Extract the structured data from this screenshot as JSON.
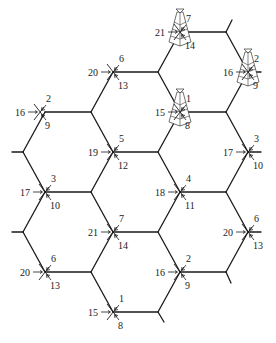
{
  "diagram": {
    "type": "hexagonal-cell-frequency-plan",
    "colors": {
      "line": "#1a1a1a",
      "background": "#ffffff"
    },
    "edges": [
      [
        12,
        152,
        23,
        152
      ],
      [
        23,
        152,
        45,
        112
      ],
      [
        23,
        152,
        45,
        192
      ],
      [
        12,
        232,
        23,
        232
      ],
      [
        23,
        232,
        45,
        192
      ],
      [
        23,
        232,
        45,
        272
      ],
      [
        45,
        112,
        91,
        112
      ],
      [
        45,
        192,
        91,
        192
      ],
      [
        45,
        272,
        91,
        272
      ],
      [
        91,
        112,
        113,
        72
      ],
      [
        91,
        112,
        113,
        152
      ],
      [
        91,
        192,
        113,
        152
      ],
      [
        91,
        192,
        113,
        232
      ],
      [
        91,
        272,
        113,
        232
      ],
      [
        91,
        272,
        113,
        312
      ],
      [
        113,
        72,
        158,
        72
      ],
      [
        113,
        152,
        158,
        152
      ],
      [
        113,
        232,
        158,
        232
      ],
      [
        113,
        312,
        158,
        312
      ],
      [
        158,
        72,
        180,
        32
      ],
      [
        158,
        72,
        180,
        112
      ],
      [
        158,
        152,
        180,
        112
      ],
      [
        158,
        152,
        180,
        192
      ],
      [
        158,
        232,
        180,
        192
      ],
      [
        158,
        232,
        180,
        272
      ],
      [
        158,
        312,
        180,
        272
      ],
      [
        158,
        312,
        164,
        322
      ],
      [
        180,
        32,
        226,
        32
      ],
      [
        180,
        112,
        226,
        112
      ],
      [
        180,
        192,
        226,
        192
      ],
      [
        180,
        272,
        226,
        272
      ],
      [
        226,
        32,
        232,
        20
      ],
      [
        226,
        32,
        248,
        72
      ],
      [
        226,
        112,
        248,
        72
      ],
      [
        226,
        112,
        248,
        152
      ],
      [
        226,
        192,
        248,
        152
      ],
      [
        226,
        192,
        248,
        232
      ],
      [
        226,
        272,
        248,
        232
      ],
      [
        226,
        272,
        231,
        283
      ],
      [
        248,
        72,
        261,
        72
      ],
      [
        248,
        152,
        261,
        152
      ],
      [
        248,
        232,
        261,
        232
      ]
    ],
    "sites": [
      {
        "id": "site-a",
        "x": 113,
        "y": 72,
        "left": "20",
        "upper": "6",
        "lower": "13",
        "antenna": false
      },
      {
        "id": "site-b",
        "x": 180,
        "y": 32,
        "left": "21",
        "upper": "7",
        "lower": "14",
        "antenna": true
      },
      {
        "id": "site-c",
        "x": 40,
        "y": 112,
        "left": "16",
        "upper": "2",
        "lower": "9",
        "antenna": false
      },
      {
        "id": "site-d",
        "x": 248,
        "y": 72,
        "left": "16",
        "upper": "2",
        "lower": "9",
        "antenna": true
      },
      {
        "id": "site-e",
        "x": 180,
        "y": 112,
        "left": "15",
        "upper": "1",
        "lower": "8",
        "antenna": true
      },
      {
        "id": "site-f",
        "x": 113,
        "y": 152,
        "left": "19",
        "upper": "5",
        "lower": "12",
        "antenna": false
      },
      {
        "id": "site-g",
        "x": 248,
        "y": 152,
        "left": "17",
        "upper": "3",
        "lower": "10",
        "antenna": false
      },
      {
        "id": "site-h",
        "x": 45,
        "y": 192,
        "left": "17",
        "upper": "3",
        "lower": "10",
        "antenna": false
      },
      {
        "id": "site-i",
        "x": 180,
        "y": 192,
        "left": "18",
        "upper": "4",
        "lower": "11",
        "antenna": false
      },
      {
        "id": "site-j",
        "x": 113,
        "y": 232,
        "left": "21",
        "upper": "7",
        "lower": "14",
        "antenna": false
      },
      {
        "id": "site-k",
        "x": 248,
        "y": 232,
        "left": "20",
        "upper": "6",
        "lower": "13",
        "antenna": false
      },
      {
        "id": "site-l",
        "x": 45,
        "y": 272,
        "left": "20",
        "upper": "6",
        "lower": "13",
        "antenna": false
      },
      {
        "id": "site-m",
        "x": 180,
        "y": 272,
        "left": "16",
        "upper": "2",
        "lower": "9",
        "antenna": false
      },
      {
        "id": "site-n",
        "x": 113,
        "y": 312,
        "left": "15",
        "upper": "1",
        "lower": "8",
        "antenna": false
      }
    ]
  }
}
